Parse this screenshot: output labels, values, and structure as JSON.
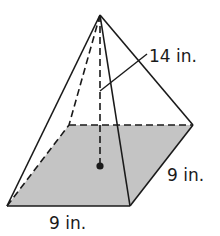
{
  "figure": {
    "type": "square pyramid",
    "labels": {
      "height": "14 in.",
      "base_side_right": "9 in.",
      "base_side_front": "9 in."
    },
    "colors": {
      "line": "#1a1a1a",
      "base_fill": "#c4c4c4",
      "background": "#ffffff"
    }
  }
}
